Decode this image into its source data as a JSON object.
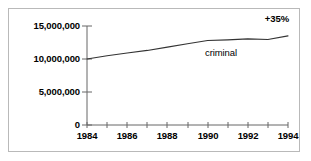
{
  "chart_data": {
    "type": "line",
    "title": "",
    "xlabel": "",
    "ylabel": "",
    "xlim": [
      1984,
      1994
    ],
    "ylim": [
      0,
      15000000
    ],
    "grid": false,
    "legend_position": "inline-right",
    "x": [
      1984,
      1985,
      1986,
      1987,
      1988,
      1989,
      1990,
      1991,
      1992,
      1993,
      1994
    ],
    "xtick_labels": [
      "1984",
      "1986",
      "1988",
      "1990",
      "1992",
      "1994"
    ],
    "xtick_values": [
      1984,
      1986,
      1988,
      1990,
      1992,
      1994
    ],
    "xtick_all": [
      1984,
      1985,
      1986,
      1987,
      1988,
      1989,
      1990,
      1991,
      1992,
      1993,
      1994
    ],
    "ytick_labels": [
      "0",
      "5,000,000",
      "10,000,000",
      "15,000,000"
    ],
    "ytick_values": [
      0,
      5000000,
      10000000,
      15000000
    ],
    "series": [
      {
        "name": "criminal",
        "values": [
          10000000,
          10500000,
          10900000,
          11300000,
          11800000,
          12300000,
          12800000,
          12900000,
          13050000,
          12950000,
          13500000
        ]
      }
    ],
    "annotations": [
      {
        "text": "+35%",
        "position": "top-right"
      }
    ]
  },
  "labels": {
    "series_criminal": "criminal",
    "annotation_change": "+35%",
    "y0": "0",
    "y1": "5,000,000",
    "y2": "10,000,000",
    "y3": "15,000,000",
    "x0": "1984",
    "x1": "1986",
    "x2": "1988",
    "x3": "1990",
    "x4": "1992",
    "x5": "1994"
  },
  "colors": {
    "line": "#333333",
    "axis": "#666666",
    "text": "#000000",
    "frame": "#b9b9b9",
    "background": "#ffffff"
  }
}
